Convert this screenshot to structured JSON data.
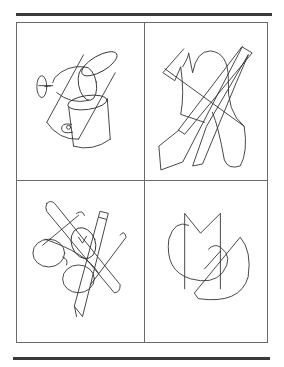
{
  "page": {
    "layout": "2x2 grid of overlapping line drawings",
    "line_color": "#333333",
    "rule_color": "#3a3a3a",
    "frame_color": "#6a6a6a"
  },
  "panels": [
    {
      "position": "top-left",
      "icon": "overlapping-glass-cup-tube-drawing",
      "items": [
        "goblet",
        "cylinder tube",
        "mug"
      ]
    },
    {
      "position": "top-right",
      "icon": "overlapping-glove-tie-feather-drawing",
      "items": [
        "glove",
        "tie",
        "feather"
      ]
    },
    {
      "position": "bottom-left",
      "icon": "overlapping-glasses-pencil-watch-drawing",
      "items": [
        "eyeglasses",
        "pencil",
        "watch",
        "brush"
      ]
    },
    {
      "position": "bottom-right",
      "icon": "overlapping-letters-drawing",
      "items": [
        "letter M",
        "letter C",
        "letter G"
      ]
    }
  ]
}
